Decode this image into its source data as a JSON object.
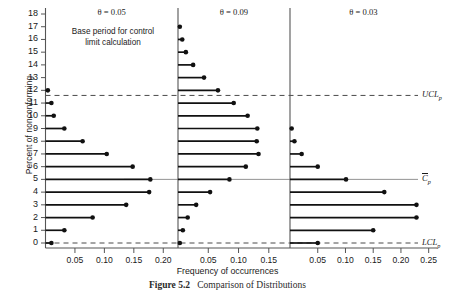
{
  "figure": {
    "caption_number": "Figure 5.2",
    "caption_text": "Comparison of Distributions",
    "xlabel": "Frequency of occurrences",
    "ylabel": "Percent of nonconforming"
  },
  "annotations": {
    "base_period_note_line1": "Base period for control",
    "base_period_note_line2": "limit calculation",
    "ucl_label": "UCL",
    "ucl_sub": "p",
    "cl_label": "C",
    "cl_sub": "p",
    "lcl_label": "LCL",
    "lcl_sub": "p"
  },
  "colors": {
    "stem": "#111111",
    "axis": "#555555",
    "dashed_limit": "#4a4a4a",
    "center_line": "#777777",
    "background": "#ffffff"
  },
  "chart_data": {
    "type": "bar",
    "title": "Comparison of Distributions",
    "xlabel": "Frequency of occurrences",
    "ylabel": "Percent of nonconforming",
    "orientation": "horizontal",
    "grid": false,
    "legend": "none",
    "ylim": [
      0,
      18
    ],
    "yticks": [
      0,
      1,
      2,
      3,
      4,
      5,
      6,
      7,
      8,
      9,
      10,
      11,
      12,
      13,
      14,
      15,
      16,
      17,
      18
    ],
    "control_limits": {
      "UCL_p": 11.6,
      "CL_p": 5.0,
      "LCL_p": 0.0
    },
    "panels": [
      {
        "name": "panel-theta-005",
        "theta_label": "θ = 0.05",
        "theta_value": 0.05,
        "note": "Base period for control limit calculation",
        "xlim": [
          0,
          0.225
        ],
        "xticks": [
          0.05,
          0.1,
          0.15,
          0.2
        ],
        "xticklabels": [
          "0.05",
          "0.10",
          "0.15",
          "0.20"
        ],
        "categories": [
          0,
          1,
          2,
          3,
          4,
          5,
          6,
          7,
          8,
          9,
          10,
          11,
          12
        ],
        "values": [
          0.01,
          0.032,
          0.08,
          0.137,
          0.176,
          0.178,
          0.148,
          0.104,
          0.063,
          0.032,
          0.014,
          0.01,
          0.004
        ]
      },
      {
        "name": "panel-theta-009",
        "theta_label": "θ = 0.09",
        "theta_value": 0.09,
        "xlim": [
          0,
          0.185
        ],
        "xticks": [
          0.05,
          0.1,
          0.15
        ],
        "xticklabels": [
          "0.05",
          "0.10",
          "0.15"
        ],
        "categories": [
          0,
          1,
          2,
          3,
          4,
          5,
          6,
          7,
          8,
          9,
          10,
          11,
          12,
          13,
          14,
          15,
          16,
          17
        ],
        "values": [
          0.003,
          0.008,
          0.016,
          0.03,
          0.053,
          0.085,
          0.112,
          0.133,
          0.13,
          0.131,
          0.115,
          0.092,
          0.066,
          0.043,
          0.025,
          0.013,
          0.007,
          0.003
        ]
      },
      {
        "name": "panel-theta-003",
        "theta_label": "θ = 0.03",
        "theta_value": 0.03,
        "xlim": [
          0,
          0.265
        ],
        "xticks": [
          0.05,
          0.1,
          0.15,
          0.2,
          0.25
        ],
        "xticklabels": [
          "0.05",
          "0.10",
          "0.15",
          "0.20",
          "0.25"
        ],
        "categories": [
          0,
          1,
          2,
          3,
          4,
          5,
          6,
          7,
          8,
          9
        ],
        "values": [
          0.05,
          0.15,
          0.228,
          0.228,
          0.17,
          0.101,
          0.05,
          0.021,
          0.008,
          0.003
        ]
      }
    ]
  }
}
